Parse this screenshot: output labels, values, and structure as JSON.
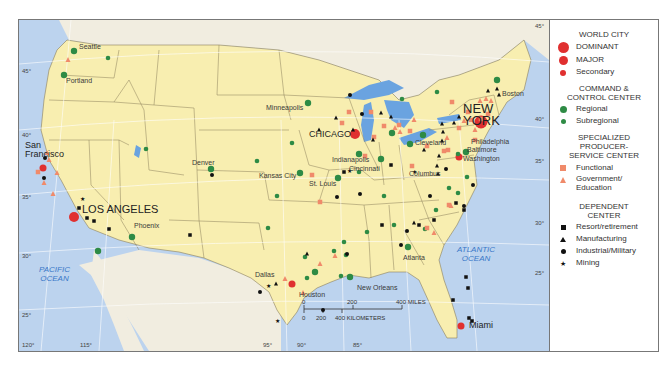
{
  "legend": {
    "world_city": {
      "heading": "WORLD CITY",
      "items": [
        {
          "label": "DOMINANT",
          "symbol": "large-red-circle",
          "color": "#e03030"
        },
        {
          "label": "MAJOR",
          "symbol": "medium-red-circle",
          "color": "#e03030"
        },
        {
          "label": "Secondary",
          "symbol": "small-red-circle",
          "color": "#e03030"
        }
      ]
    },
    "command_control": {
      "heading": "COMMAND & CONTROL CENTER",
      "items": [
        {
          "label": "Regional",
          "symbol": "medium-green-circle",
          "color": "#2e8b45"
        },
        {
          "label": "Subregional",
          "symbol": "small-green-circle",
          "color": "#2e8b45"
        }
      ]
    },
    "producer_service": {
      "heading": "SPECIALIZED PRODUCER-SERVICE CENTER",
      "items": [
        {
          "label": "Functional",
          "symbol": "orange-square",
          "color": "#f08a6a"
        },
        {
          "label": "Government/ Education",
          "symbol": "orange-triangle",
          "color": "#f08a6a"
        }
      ]
    },
    "dependent": {
      "heading": "DEPENDENT CENTER",
      "items": [
        {
          "label": "Resort/retirement",
          "symbol": "black-square",
          "color": "#111111"
        },
        {
          "label": "Manufacturing",
          "symbol": "black-triangle",
          "color": "#111111"
        },
        {
          "label": "Industrial/Military",
          "symbol": "black-circle",
          "color": "#111111"
        },
        {
          "label": "Mining",
          "symbol": "black-star",
          "color": "#111111"
        }
      ]
    }
  },
  "cities": [
    {
      "name": "NEW YORK",
      "class": "dominant"
    },
    {
      "name": "LOS ANGELES",
      "class": "major"
    },
    {
      "name": "CHICAGO",
      "class": "major"
    },
    {
      "name": "San Francisco",
      "class": "secondary"
    },
    {
      "name": "Miami",
      "class": "secondary"
    },
    {
      "name": "Houston",
      "class": "secondary"
    },
    {
      "name": "Washington",
      "class": "secondary"
    },
    {
      "name": "Seattle",
      "class": "regional"
    },
    {
      "name": "Portland",
      "class": "regional"
    },
    {
      "name": "Denver",
      "class": "regional"
    },
    {
      "name": "Phoenix",
      "class": "regional"
    },
    {
      "name": "Minneapolis",
      "class": "regional"
    },
    {
      "name": "Kansas City",
      "class": "regional"
    },
    {
      "name": "St. Louis",
      "class": "regional"
    },
    {
      "name": "Dallas",
      "class": "regional"
    },
    {
      "name": "New Orleans",
      "class": "regional"
    },
    {
      "name": "Atlanta",
      "class": "regional"
    },
    {
      "name": "Indianapolis",
      "class": "regional"
    },
    {
      "name": "Cincinnati",
      "class": "regional"
    },
    {
      "name": "Columbus",
      "class": "regional"
    },
    {
      "name": "Cleveland",
      "class": "regional"
    },
    {
      "name": "Boston",
      "class": "regional"
    },
    {
      "name": "Philadelphia",
      "class": "regional"
    },
    {
      "name": "Baltimore",
      "class": "regional"
    }
  ],
  "labels": {
    "new_york_1": "NEW",
    "new_york_2": "YORK",
    "los_angeles": "LOS ANGELES",
    "chicago": "CHICAGO",
    "san_francisco_1": "San",
    "san_francisco_2": "Francisco",
    "seattle": "Seattle",
    "portland": "Portland",
    "denver": "Denver",
    "phoenix": "Phoenix",
    "minneapolis": "Minneapolis",
    "kansas_city": "Kansas City",
    "st_louis": "St. Louis",
    "dallas": "Dallas",
    "houston": "Houston",
    "new_orleans": "New Orleans",
    "atlanta": "Atlanta",
    "indianapolis": "Indianapolis",
    "cincinnati": "Cincinnati",
    "columbus": "Columbus",
    "cleveland": "Cleveland",
    "boston": "Boston",
    "philadelphia": "Philadelphia",
    "baltimore": "Baltimore",
    "washington": "Washington",
    "miami": "Miami"
  },
  "oceans": {
    "pacific_1": "PACIFIC",
    "pacific_2": "OCEAN",
    "atlantic_1": "ATLANTIC",
    "atlantic_2": "OCEAN"
  },
  "graticule": {
    "latitudes": [
      "45°",
      "40°",
      "35°",
      "30°",
      "25°"
    ],
    "latitudes_east": [
      "45°",
      "40°",
      "35°",
      "30°",
      "25°"
    ],
    "longitudes": [
      "120°",
      "115°",
      "95°",
      "90°",
      "85°"
    ]
  },
  "scale_bar": {
    "miles_ticks": [
      "0",
      "200",
      "400 MILES"
    ],
    "km_ticks": [
      "0",
      "200",
      "400 KILOMETERS"
    ]
  },
  "colors": {
    "land_us": "#f8eeb0",
    "land_other": "#f1ede0",
    "water": "#bcd3ee",
    "lakes": "#6aa3e0",
    "world_city": "#e03030",
    "command": "#2e8b45",
    "producer": "#f08a6a",
    "dependent": "#111111"
  }
}
